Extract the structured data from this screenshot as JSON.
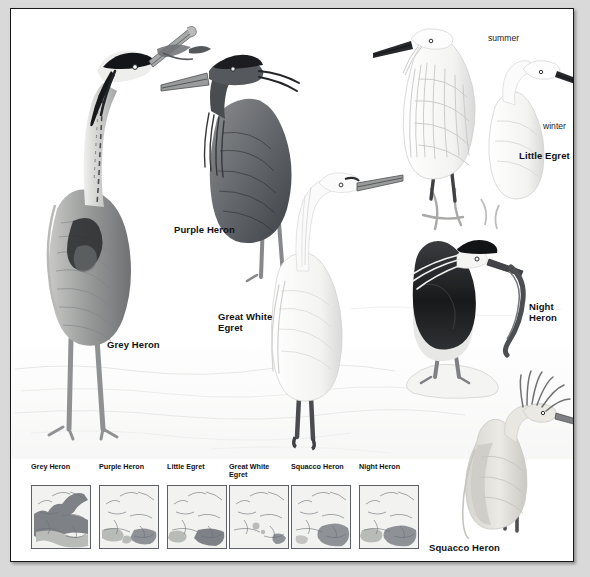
{
  "plate": {
    "background_color": "#d9d9d9",
    "paper_color": "#ffffff",
    "border_color": "#17181a",
    "type": "field-guide-illustration-plate",
    "subject": "Herons and Egrets of Europe"
  },
  "species_labels": [
    {
      "name": "grey-heron",
      "text": "Grey Heron",
      "x": 96,
      "y": 330,
      "size": 9.5
    },
    {
      "name": "purple-heron",
      "text": "Purple Heron",
      "x": 163,
      "y": 215,
      "size": 9.5
    },
    {
      "name": "great-white-egret",
      "text": "Great White\nEgret",
      "x": 218,
      "y": 308,
      "size": 9.5
    },
    {
      "name": "little-egret",
      "text": "Little Egret",
      "x": 519,
      "y": 147,
      "size": 9.5
    },
    {
      "name": "night-heron",
      "text": "Night\nHeron",
      "x": 528,
      "y": 299,
      "size": 9.5
    },
    {
      "name": "squacco-heron",
      "text": "Squacco Heron",
      "x": 428,
      "y": 544,
      "size": 9.5
    }
  ],
  "annotations": [
    {
      "name": "summer-plumage",
      "text": "summer",
      "x": 487,
      "y": 31
    },
    {
      "name": "winter-plumage",
      "text": "winter",
      "x": 542,
      "y": 119
    }
  ],
  "birds": [
    {
      "name": "grey-heron",
      "common_name": "Grey Heron",
      "pose": "standing upright, head raised, bill pointing up-right",
      "plumage": "pale grey body, white head and neck, black crest plume, dark neck streaking",
      "tone": "mid grey"
    },
    {
      "name": "purple-heron",
      "common_name": "Purple Heron",
      "pose": "standing hunched, bill pointing left",
      "plumage": "dark slate crown and mantle, shaggy breast plumes, dark wings",
      "tone": "dark grey"
    },
    {
      "name": "great-white-egret",
      "common_name": "Great White Egret",
      "pose": "standing in shallow water, neck extended, bill pointing right",
      "plumage": "all white, dark legs and feet",
      "tone": "white"
    },
    {
      "name": "little-egret-summer",
      "common_name": "Little Egret",
      "season": "summer",
      "pose": "perched, bill pointing left, aigrette plumes raised",
      "plumage": "all white with long wispy nape and scapular plumes, black bill",
      "tone": "white"
    },
    {
      "name": "little-egret-winter",
      "common_name": "Little Egret",
      "season": "winter",
      "pose": "head and neck study, bill pointing right",
      "plumage": "all white, black bill, no plumes",
      "tone": "white"
    },
    {
      "name": "night-heron",
      "common_name": "Night Heron",
      "pose": "standing on rock, holding an eel in the bill",
      "plumage": "black crown and mantle, white face and underparts, long white nape plumes",
      "tone": "black and white"
    },
    {
      "name": "squacco-heron",
      "common_name": "Squacco Heron",
      "pose": "standing in water, head plumes fanned up",
      "plumage": "buff body, shaggy streaked crest, white wings",
      "tone": "pale buff"
    }
  ],
  "map_strip": {
    "title_note": "European distribution maps",
    "maps": [
      {
        "name": "map-grey-heron",
        "title": "Grey Heron",
        "x": 12,
        "range_description": "widespread across most of Europe, dense in the west and centre"
      },
      {
        "name": "map-purple-heron",
        "title": "Purple Heron",
        "x": 80,
        "range_description": "scattered southern and south-eastern Europe, Iberia, Italy, Balkans"
      },
      {
        "name": "map-little-egret",
        "title": "Little Egret",
        "x": 148,
        "range_description": "Mediterranean basin and south-eastern Europe"
      },
      {
        "name": "map-great-white-egret",
        "title": "Great White\nEgret",
        "x": 210,
        "range_description": "very local, small pockets in central and south-eastern Europe"
      },
      {
        "name": "map-squacco-heron",
        "title": "Squacco Heron",
        "x": 272,
        "range_description": "south-eastern Europe, Balkans and Black Sea region"
      },
      {
        "name": "map-night-heron",
        "title": "Night Heron",
        "x": 340,
        "range_description": "southern and south-eastern Europe, Iberia, Italy, Balkans"
      }
    ]
  },
  "colors": {
    "paper": "#ffffff",
    "outer_margin": "#d9d9d9",
    "ink": "#101114",
    "map_land": "#f2f2f0",
    "map_outline": "#6b6f75",
    "map_range_light": "#b9bbb8",
    "map_range_dark": "#7e8186"
  }
}
